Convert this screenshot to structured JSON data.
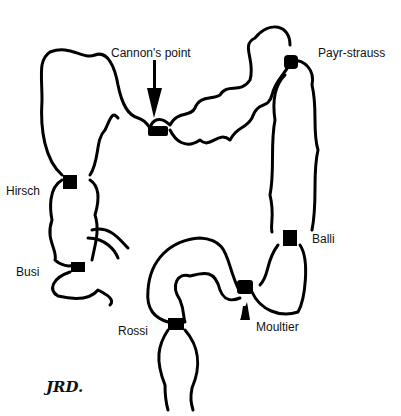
{
  "diagram": {
    "labels": {
      "cannon": "Cannon's point",
      "payr": "Payr-strauss",
      "hirsch": "Hirsch",
      "busi": "Busi",
      "balli": "Balli",
      "rossi": "Rossi",
      "moultier": "Moultier"
    },
    "signature": "JRD.",
    "colors": {
      "stroke": "#000000",
      "fill": "#ffffff",
      "background": "#ffffff"
    }
  }
}
